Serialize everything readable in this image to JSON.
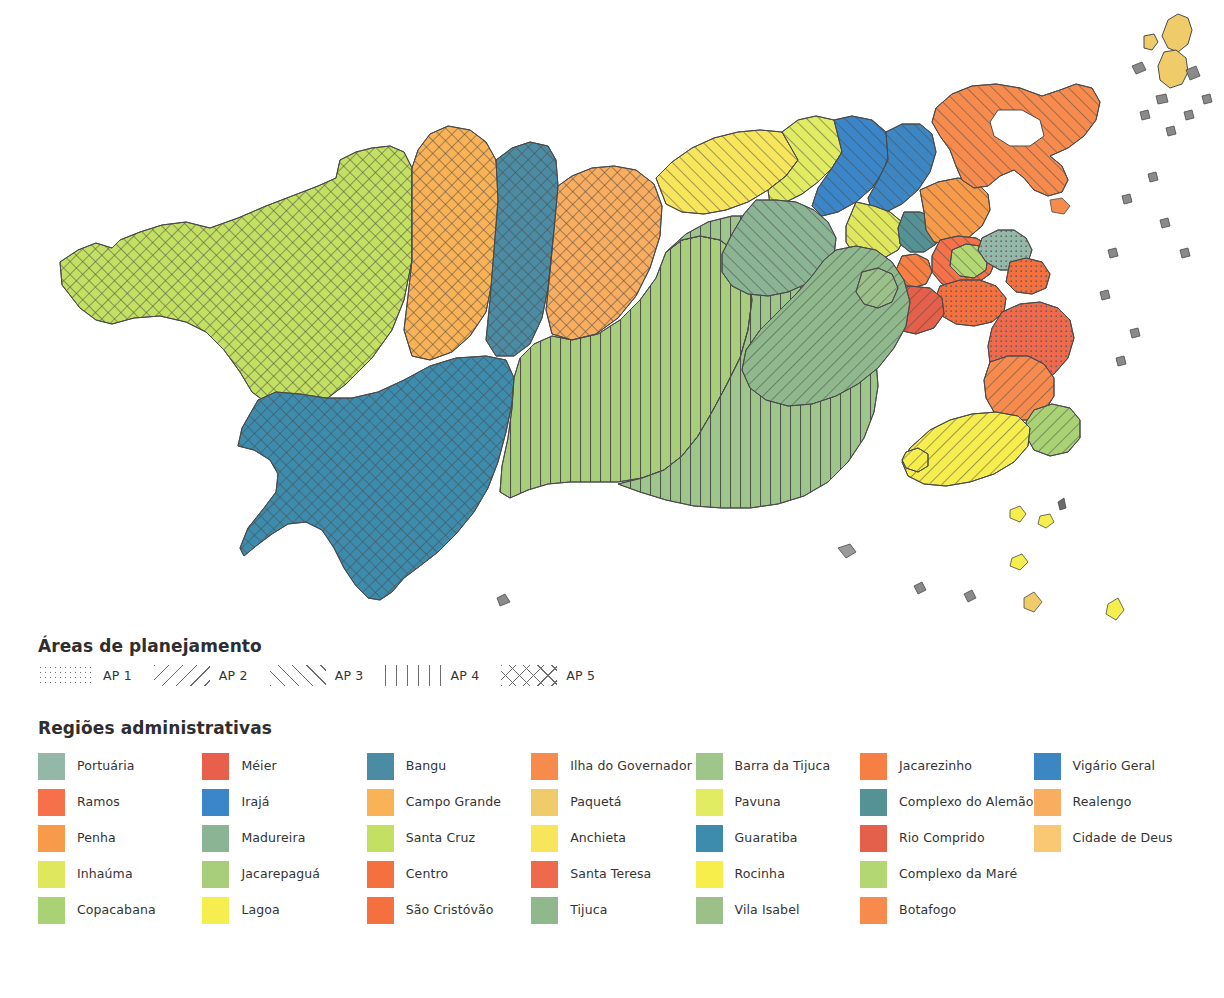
{
  "map": {
    "title_alt": "Mapa das Regiões Administrativas do Rio de Janeiro",
    "ocean_color": "#ffffff",
    "outline_color": "#4a4a4a"
  },
  "ap_legend": {
    "title": "Áreas de planejamento",
    "items": [
      {
        "label": "AP 1",
        "pattern": "dots",
        "pattern_class": "pat-ap1"
      },
      {
        "label": "AP 2",
        "pattern": "diagonal-back",
        "pattern_class": "pat-ap2"
      },
      {
        "label": "AP 3",
        "pattern": "diagonal-forward",
        "pattern_class": "pat-ap3"
      },
      {
        "label": "AP 4",
        "pattern": "vertical-lines",
        "pattern_class": "pat-ap4"
      },
      {
        "label": "AP 5",
        "pattern": "crosshatch",
        "pattern_class": "pat-ap5"
      }
    ]
  },
  "ra_legend": {
    "title": "Regiões administrativas",
    "columns": 7,
    "rows": 5,
    "items": [
      {
        "label": "Portuária",
        "color": "#93b8a8"
      },
      {
        "label": "Ramos",
        "color": "#f4714a"
      },
      {
        "label": "Penha",
        "color": "#f79b4b"
      },
      {
        "label": "Inhaúma",
        "color": "#dfe85c"
      },
      {
        "label": "Copacabana",
        "color": "#a9d274"
      },
      {
        "label": "Méier",
        "color": "#e8604c"
      },
      {
        "label": "Irajá",
        "color": "#3a86c8"
      },
      {
        "label": "Madureira",
        "color": "#8ab494"
      },
      {
        "label": "Jacarepaguá",
        "color": "#a8ce7c"
      },
      {
        "label": "Lagoa",
        "color": "#f6ee4e"
      },
      {
        "label": "Bangu",
        "color": "#4b8ca4"
      },
      {
        "label": "Campo Grande",
        "color": "#f9b356"
      },
      {
        "label": "Santa Cruz",
        "color": "#c3e062"
      },
      {
        "label": "Centro",
        "color": "#f4703f"
      },
      {
        "label": "São Cristóvão",
        "color": "#f4703f"
      },
      {
        "label": "Ilha do Governador",
        "color": "#f78b4e"
      },
      {
        "label": "Paquetá",
        "color": "#efcb6a"
      },
      {
        "label": "Anchieta",
        "color": "#f7e65c"
      },
      {
        "label": "Santa Teresa",
        "color": "#ef6a4c"
      },
      {
        "label": "Tijuca",
        "color": "#8fb98c"
      },
      {
        "label": "Barra da Tijuca",
        "color": "#9ec68a"
      },
      {
        "label": "Pavuna",
        "color": "#e2ec63"
      },
      {
        "label": "Guaratiba",
        "color": "#3d8cae"
      },
      {
        "label": "Rocinha",
        "color": "#f7ee4c"
      },
      {
        "label": "Vila Isabel",
        "color": "#9cc089"
      },
      {
        "label": "Jacarezinho",
        "color": "#f77f43"
      },
      {
        "label": "Complexo do Alemão",
        "color": "#549296"
      },
      {
        "label": "Rio Comprido",
        "color": "#e4604a"
      },
      {
        "label": "Complexo da Maré",
        "color": "#b3d873"
      },
      {
        "label": "Botafogo",
        "color": "#f78b4e"
      },
      {
        "label": "Vigário Geral",
        "color": "#3d86c4"
      },
      {
        "label": "Realengo",
        "color": "#f9ad5f"
      },
      {
        "label": "Cidade de Deus",
        "color": "#f9c873"
      },
      {
        "label": "",
        "color": "transparent"
      },
      {
        "label": "",
        "color": "transparent"
      }
    ]
  },
  "map_regions": [
    {
      "name": "Santa Cruz",
      "color": "#c3e062",
      "ap": "AP 5"
    },
    {
      "name": "Campo Grande",
      "color": "#f9b356",
      "ap": "AP 5"
    },
    {
      "name": "Guaratiba",
      "color": "#3d8cae",
      "ap": "AP 5"
    },
    {
      "name": "Bangu",
      "color": "#4b8ca4",
      "ap": "AP 5"
    },
    {
      "name": "Realengo",
      "color": "#f9ad5f",
      "ap": "AP 5"
    },
    {
      "name": "Jacarepaguá",
      "color": "#a8ce7c",
      "ap": "AP 4"
    },
    {
      "name": "Barra da Tijuca",
      "color": "#9ec68a",
      "ap": "AP 4"
    },
    {
      "name": "Cidade de Deus",
      "color": "#f9c873",
      "ap": "AP 4"
    },
    {
      "name": "Anchieta",
      "color": "#f7e65c",
      "ap": "AP 3"
    },
    {
      "name": "Pavuna",
      "color": "#e2ec63",
      "ap": "AP 3"
    },
    {
      "name": "Irajá",
      "color": "#3a86c8",
      "ap": "AP 3"
    },
    {
      "name": "Vigário Geral",
      "color": "#3d86c4",
      "ap": "AP 3"
    },
    {
      "name": "Madureira",
      "color": "#8ab494",
      "ap": "AP 3"
    },
    {
      "name": "Ilha do Governador",
      "color": "#f78b4e",
      "ap": "AP 3"
    },
    {
      "name": "Ramos",
      "color": "#f4714a",
      "ap": "AP 3"
    },
    {
      "name": "Penha",
      "color": "#f79b4b",
      "ap": "AP 3"
    },
    {
      "name": "Méier",
      "color": "#e8604c",
      "ap": "AP 3"
    },
    {
      "name": "Inhaúma",
      "color": "#dfe85c",
      "ap": "AP 3"
    },
    {
      "name": "Complexo do Alemão",
      "color": "#549296",
      "ap": "AP 3"
    },
    {
      "name": "Jacarezinho",
      "color": "#f77f43",
      "ap": "AP 3"
    },
    {
      "name": "Complexo da Maré",
      "color": "#b3d873",
      "ap": "AP 3"
    },
    {
      "name": "Centro",
      "color": "#f4703f",
      "ap": "AP 1"
    },
    {
      "name": "Portuária",
      "color": "#93b8a8",
      "ap": "AP 1"
    },
    {
      "name": "São Cristóvão",
      "color": "#f4703f",
      "ap": "AP 1"
    },
    {
      "name": "Santa Teresa",
      "color": "#ef6a4c",
      "ap": "AP 1"
    },
    {
      "name": "Rio Comprido",
      "color": "#e4604a",
      "ap": "AP 1"
    },
    {
      "name": "Paquetá",
      "color": "#efcb6a",
      "ap": "AP 1"
    },
    {
      "name": "Tijuca",
      "color": "#8fb98c",
      "ap": "AP 2"
    },
    {
      "name": "Vila Isabel",
      "color": "#9cc089",
      "ap": "AP 2"
    },
    {
      "name": "Botafogo",
      "color": "#f78b4e",
      "ap": "AP 2"
    },
    {
      "name": "Copacabana",
      "color": "#a9d274",
      "ap": "AP 2"
    },
    {
      "name": "Lagoa",
      "color": "#f6ee4e",
      "ap": "AP 2"
    },
    {
      "name": "Rocinha",
      "color": "#f7ee4c",
      "ap": "AP 2"
    }
  ]
}
